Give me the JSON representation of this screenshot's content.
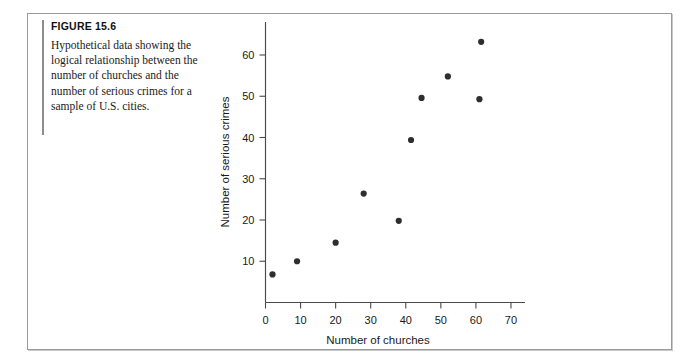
{
  "figure": {
    "number_label": "FIGURE 15.6",
    "caption": "Hypothetical data showing the logical relationship between the number of churches and the number of serious crimes for a sample of U.S. cities."
  },
  "chart_data": {
    "type": "scatter",
    "title": "",
    "xlabel": "Number of churches",
    "ylabel": "Number of serious crimes",
    "xlim": [
      0,
      74
    ],
    "ylim": [
      0,
      68
    ],
    "xticks": [
      0,
      10,
      20,
      30,
      40,
      50,
      60,
      70
    ],
    "yticks": [
      10,
      20,
      30,
      40,
      50,
      60
    ],
    "grid": false,
    "legend": null,
    "marker_color": "#2e2e2e",
    "points": [
      {
        "x": 2,
        "y": 6.8
      },
      {
        "x": 9,
        "y": 10.0
      },
      {
        "x": 20,
        "y": 14.5
      },
      {
        "x": 28,
        "y": 26.4
      },
      {
        "x": 38,
        "y": 19.8
      },
      {
        "x": 41.5,
        "y": 39.4
      },
      {
        "x": 44.5,
        "y": 49.6
      },
      {
        "x": 52,
        "y": 54.8
      },
      {
        "x": 61,
        "y": 49.3
      },
      {
        "x": 61.5,
        "y": 63.2
      }
    ]
  },
  "colors": {
    "axis": "#4a4a4a",
    "text": "#1a1a1a",
    "frame": "#9a9a9a"
  }
}
